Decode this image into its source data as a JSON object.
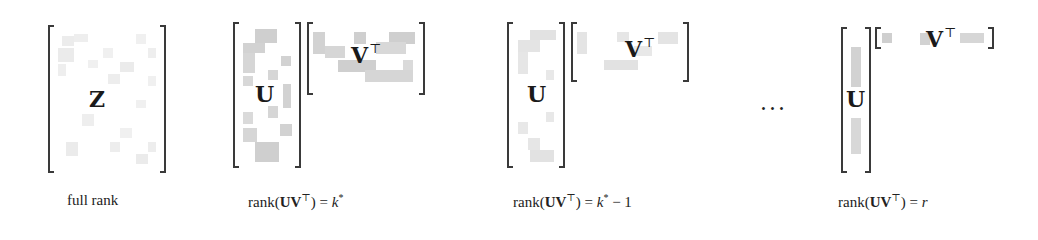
{
  "figure": {
    "panels": [
      {
        "id": "full-rank",
        "matrix_symbol": "Z",
        "caption": "full rank",
        "caption_parts": {
          "text": "full rank"
        }
      },
      {
        "id": "rank-k-star",
        "left_symbol": "U",
        "right_symbol": "V",
        "right_sup": "⊤",
        "caption_parts": {
          "prefix": "rank(",
          "bold": "UV",
          "sup": "⊤",
          "suffix": ") = ",
          "var": "k",
          "var_sup": "*",
          "tail": ""
        }
      },
      {
        "id": "rank-k-star-minus-1",
        "left_symbol": "U",
        "right_symbol": "V",
        "right_sup": "⊤",
        "caption_parts": {
          "prefix": "rank(",
          "bold": "UV",
          "sup": "⊤",
          "suffix": ") = ",
          "var": "k",
          "var_sup": "*",
          "tail": " − 1"
        }
      },
      {
        "id": "rank-r",
        "left_symbol": "U",
        "right_symbol": "V",
        "right_sup": "⊤",
        "caption_parts": {
          "prefix": "rank(",
          "bold": "UV",
          "sup": "⊤",
          "suffix": ") = ",
          "var": "r",
          "var_sup": "",
          "tail": ""
        }
      }
    ],
    "ellipsis": "···",
    "colors": {
      "bracket": "#3a3a3a",
      "cell_dark": "#c8c8c8",
      "cell_light": "#e6e6e6",
      "background": "#ffffff"
    }
  }
}
